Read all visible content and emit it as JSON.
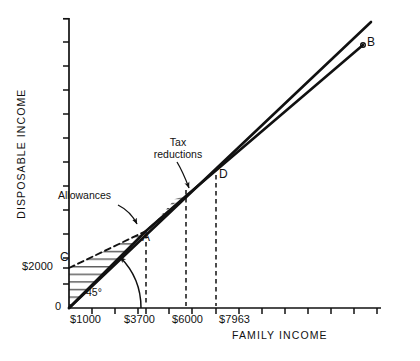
{
  "chart_data": {
    "type": "line",
    "title": "",
    "xlabel": "FAMILY INCOME",
    "ylabel": "DISPOSABLE INCOME",
    "xlim": [
      0,
      13000
    ],
    "ylim": [
      0,
      13000
    ],
    "grid": false,
    "legend_position": "none",
    "origin_label": "0",
    "x_tick_labels": [
      "$1000",
      "$3700",
      "$6000",
      "$7963"
    ],
    "x_tick_values": [
      1000,
      3700,
      6000,
      7963
    ],
    "y_tick_labels": [
      "$2000"
    ],
    "y_tick_values": [
      2000
    ],
    "series": [
      {
        "name": "45-degree line",
        "style": "solid",
        "points": [
          [
            0,
            0
          ],
          [
            12200,
            12200
          ]
        ]
      },
      {
        "name": "disposable income schedule",
        "style": "solid",
        "points": [
          [
            0,
            0
          ],
          [
            3700,
            3700
          ],
          [
            6000,
            5750
          ],
          [
            11400,
            10300
          ]
        ]
      },
      {
        "name": "allowance line",
        "style": "dashed",
        "points": [
          [
            0,
            2000
          ],
          [
            3700,
            3700
          ],
          [
            6000,
            5750
          ]
        ]
      }
    ],
    "annotations": [
      {
        "label": "Allowances",
        "x": 1500,
        "y": 5200
      },
      {
        "label": "Tax\nreductions",
        "x": 4100,
        "y": 7600
      },
      {
        "label": "45°",
        "x": 900,
        "y": 500
      }
    ],
    "point_labels": [
      {
        "label": "C",
        "x": 0,
        "y": 2000
      },
      {
        "label": "A",
        "x": 3700,
        "y": 3700
      },
      {
        "label": "D",
        "x": 7963,
        "y": 7963
      },
      {
        "label": "B",
        "x": 11400,
        "y": 10300
      }
    ],
    "shaded_regions": [
      {
        "name": "allowances",
        "hatch": "horizontal"
      },
      {
        "name": "tax-reductions",
        "hatch": "horizontal"
      }
    ]
  },
  "axes": {
    "x_title": "FAMILY INCOME",
    "y_title": "DISPOSABLE INCOME",
    "origin": "0"
  },
  "ticks": {
    "x": [
      "$1000",
      "$3700",
      "$6000",
      "$7963"
    ],
    "y": [
      "$2000"
    ]
  },
  "annotations": {
    "allowances": "Allowances",
    "tax_reductions": "Tax\nreductions",
    "angle": "45°"
  },
  "points": {
    "c": "C",
    "a": "A",
    "d": "D",
    "b": "B"
  },
  "colors": {
    "ink": "#111111",
    "background": "#ffffff"
  }
}
